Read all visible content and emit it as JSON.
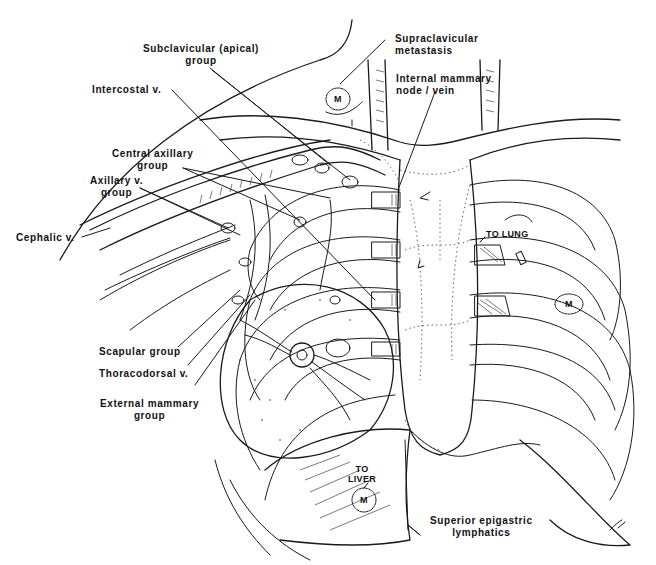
{
  "figure": {
    "labels": {
      "subclavicular": {
        "line1": "Subclavicular (apical)",
        "line2": "group"
      },
      "intercostal_v": "Intercostal v.",
      "central_axillary": {
        "line1": "Central axillary",
        "line2": "group"
      },
      "axillary_v": {
        "line1": "Axillary v.",
        "line2": "group"
      },
      "cephalic_v": "Cephalic v.",
      "supraclavicular": {
        "line1": "Supraclavicular",
        "line2": "metastasis"
      },
      "internal_mammary": {
        "line1": "Internal mammary",
        "line2": "node / vein"
      },
      "to_lung": "TO LUNG",
      "scapular_group": "Scapular group",
      "thoracodorsal_v": "Thoracodorsal v.",
      "external_mammary": {
        "line1": "External mammary",
        "line2": "group"
      },
      "to_liver": {
        "line1": "TO",
        "line2": "LIVER"
      },
      "superior_epigastric": {
        "line1": "Superior epigastric",
        "line2": "lymphatics"
      },
      "metastasis_marker": "M"
    },
    "colors": {
      "ink": "#1a1a1a",
      "background": "#ffffff"
    }
  }
}
